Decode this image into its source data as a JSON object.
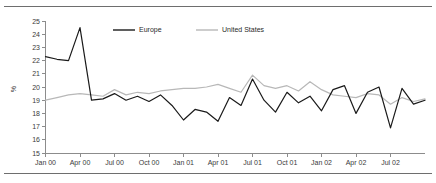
{
  "chart_data": {
    "type": "line",
    "title": "",
    "xlabel": "",
    "ylabel": "%",
    "ylim": [
      15,
      25
    ],
    "yticks": [
      15,
      16,
      17,
      18,
      19,
      20,
      21,
      22,
      23,
      24,
      25
    ],
    "grid": false,
    "legend_position": "top-center",
    "x_tick_labels": [
      "Jan 00",
      "Apr 00",
      "Jul 00",
      "Oct 00",
      "Jan 01",
      "Apr 01",
      "Jul 01",
      "Oct 01",
      "Jan 02",
      "Apr 02",
      "Jul 02"
    ],
    "x_tick_index": [
      0,
      3,
      6,
      9,
      12,
      15,
      18,
      21,
      24,
      27,
      30
    ],
    "x": [
      "Jan 00",
      "Feb 00",
      "Mar 00",
      "Apr 00",
      "May 00",
      "Jun 00",
      "Jul 00",
      "Aug 00",
      "Sep 00",
      "Oct 00",
      "Nov 00",
      "Dec 00",
      "Jan 01",
      "Feb 01",
      "Mar 01",
      "Apr 01",
      "May 01",
      "Jun 01",
      "Jul 01",
      "Aug 01",
      "Sep 01",
      "Oct 01",
      "Nov 01",
      "Dec 01",
      "Jan 02",
      "Feb 02",
      "Mar 02",
      "Apr 02",
      "May 02",
      "Jun 02",
      "Jul 02",
      "Aug 02",
      "Sep 02",
      "Oct 02"
    ],
    "series": [
      {
        "name": "Europe",
        "color": "#1a1a1a",
        "values": [
          22.3,
          22.1,
          22.0,
          24.5,
          19.0,
          19.1,
          19.5,
          19.0,
          19.3,
          18.9,
          19.4,
          18.6,
          17.5,
          18.3,
          18.1,
          17.4,
          19.2,
          18.6,
          20.6,
          19.0,
          18.1,
          19.6,
          18.8,
          19.3,
          18.2,
          19.8,
          20.1,
          18.0,
          19.6,
          20.0,
          16.9,
          19.9,
          18.7,
          19.0
        ]
      },
      {
        "name": "United States",
        "color": "#b8b8b8",
        "values": [
          19.0,
          19.2,
          19.4,
          19.5,
          19.4,
          19.3,
          19.8,
          19.4,
          19.6,
          19.5,
          19.7,
          19.8,
          19.9,
          19.9,
          20.0,
          20.2,
          19.9,
          19.6,
          20.9,
          20.1,
          19.9,
          20.1,
          19.7,
          20.4,
          19.8,
          19.4,
          19.3,
          19.2,
          19.5,
          19.4,
          18.7,
          19.2,
          18.9,
          19.1
        ]
      }
    ]
  },
  "legend": {
    "items": [
      {
        "label": "Europe",
        "color": "#1a1a1a"
      },
      {
        "label": "United States",
        "color": "#b8b8b8"
      }
    ]
  }
}
